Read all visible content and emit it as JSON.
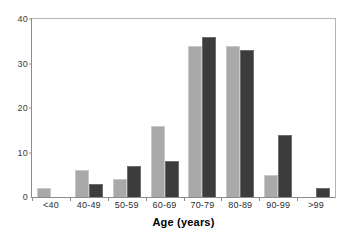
{
  "chart_data": {
    "type": "bar",
    "title": "",
    "xlabel": "Age (years)",
    "ylabel": "",
    "categories": [
      "<40",
      "40-49",
      "50-59",
      "60-69",
      "70-79",
      "80-89",
      "90-99",
      ">99"
    ],
    "series": [
      {
        "name": "light-gray-series",
        "color": "#a9a9a9",
        "values": [
          2,
          6,
          4,
          16,
          34,
          34,
          5,
          0
        ]
      },
      {
        "name": "dark-gray-series",
        "color": "#3c3c3c",
        "values": [
          0,
          3,
          7,
          8,
          36,
          33,
          14,
          2
        ]
      }
    ],
    "ylim": [
      0,
      40
    ],
    "yticks": [
      0,
      10,
      20,
      30,
      40
    ],
    "ytick_labels": [
      "0",
      "10",
      "20",
      "30",
      "40"
    ],
    "grid": false,
    "legend": "none"
  }
}
